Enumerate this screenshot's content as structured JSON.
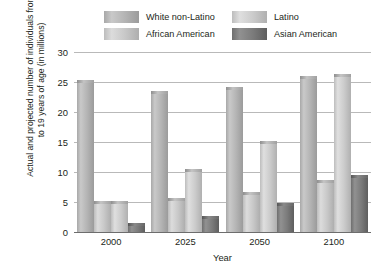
{
  "chart_data": {
    "type": "bar",
    "title": "",
    "xlabel": "Year",
    "ylabel": "Actual and projected number of individuals from 10 to 19 years of age (in millions)",
    "categories": [
      "2000",
      "2025",
      "2050",
      "2100"
    ],
    "series": [
      {
        "name": "White non-Latino",
        "color": "#b4b4b4",
        "values": [
          25.0,
          23.2,
          23.8,
          25.7
        ]
      },
      {
        "name": "African American",
        "color": "#c8c8c8",
        "values": [
          4.9,
          5.4,
          6.4,
          8.3
        ]
      },
      {
        "name": "Latino",
        "color": "#cbcbcb",
        "values": [
          4.8,
          10.2,
          14.8,
          26.0
        ]
      },
      {
        "name": "Asian American",
        "color": "#7b7b7b",
        "values": [
          1.2,
          2.4,
          4.5,
          9.2
        ]
      }
    ],
    "ylim": [
      0,
      30
    ],
    "yticks": [
      0,
      5,
      10,
      15,
      20,
      25,
      30
    ],
    "ytick_labels": [
      "0",
      "5",
      "10",
      "15",
      "20",
      "25",
      "30"
    ],
    "grid": true,
    "legend_position": "top"
  },
  "legend": {
    "entries": [
      {
        "label": "White non-Latino",
        "swatch": "white-non-latino"
      },
      {
        "label": "Latino",
        "swatch": "latino"
      },
      {
        "label": "African American",
        "swatch": "african-american"
      },
      {
        "label": "Asian American",
        "swatch": "asian-american"
      }
    ]
  }
}
